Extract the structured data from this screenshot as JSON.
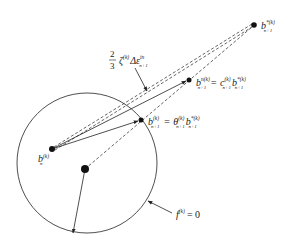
{
  "diagram": {
    "title": "",
    "labels": {
      "b_n": {
        "base": "b",
        "sub": "n",
        "sup": "(k)"
      },
      "b_star": {
        "base": "b",
        "sub": "n+1",
        "sup": "*(k)"
      },
      "b_n_mid": {
        "lhs_base": "b",
        "lhs_sub": "n+1",
        "lhs_sup": "n(k)",
        "eq": "=",
        "coef_base": "c",
        "coef_sub": "n+1",
        "coef_sup": "(k)",
        "rhs_base": "b",
        "rhs_sub": "n+1",
        "rhs_sup": "*(k)"
      },
      "b_surface": {
        "lhs_base": "b",
        "lhs_sub": "n+1",
        "lhs_sup": "(k)",
        "eq": "=",
        "coef_base": "θ",
        "coef_sub": "n+1",
        "coef_sup": "(k)",
        "rhs_base": "b",
        "rhs_sub": "n+1",
        "rhs_sup": "*(k)"
      },
      "increment": {
        "frac_num": "2",
        "frac_den": "3",
        "zeta": "ζ",
        "zeta_sup": "(k)",
        "delta": "Δε",
        "delta_sub": "n+1",
        "delta_sup": "in"
      },
      "yield": {
        "f": "f",
        "f_sup": "(k)",
        "eq": "= 0"
      }
    },
    "points": {
      "b_n": [
        52,
        149
      ],
      "center": [
        85,
        169
      ],
      "b_surface": [
        141,
        120
      ],
      "b_mid": [
        189,
        80
      ],
      "b_star": [
        254,
        25
      ],
      "radius_end": [
        73,
        233
      ]
    },
    "circle": {
      "cx": 87,
      "cy": 163,
      "r": 70
    },
    "colors": {
      "stroke": "#222222",
      "background": "#ffffff"
    }
  }
}
